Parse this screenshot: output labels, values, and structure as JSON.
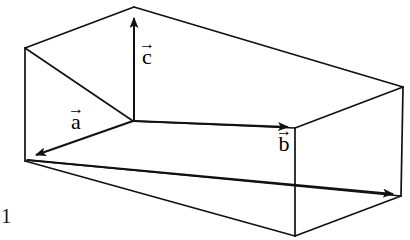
{
  "figure": {
    "stroke_color": "#111111",
    "background_color": "#ffffff",
    "stroke_width": 1.7,
    "vectors": [
      {
        "id": "a",
        "label": "a",
        "accent": "→",
        "label_text": "a⃗",
        "origin": [
          133,
          121
        ],
        "tip": [
          27,
          158
        ],
        "direction": "down-left",
        "label_position": [
          68,
          104
        ]
      },
      {
        "id": "b",
        "label": "b",
        "accent": "→",
        "label_text": "b⃗",
        "origin": [
          133,
          121
        ],
        "tip": [
          295,
          128
        ],
        "direction": "right",
        "label_position": [
          276,
          126
        ]
      },
      {
        "id": "c",
        "label": "c",
        "accent": "→",
        "label_text": "c⃗",
        "origin": [
          133,
          121
        ],
        "tip": [
          134,
          7
        ],
        "direction": "up",
        "label_position": [
          139,
          39
        ]
      }
    ],
    "box_vertices": {
      "back_top_left": [
        25,
        48
      ],
      "back_bottom_left": [
        25,
        161
      ],
      "top_near_left": [
        134,
        7
      ],
      "top_far_right": [
        403,
        87
      ],
      "origin_vertex": [
        133,
        121
      ],
      "front_top_right": [
        295,
        128
      ],
      "front_bottom_right": [
        295,
        236
      ],
      "bottom_far_right": [
        401,
        196
      ],
      "bottom_near": [
        295,
        236
      ]
    },
    "page_number": "1"
  }
}
